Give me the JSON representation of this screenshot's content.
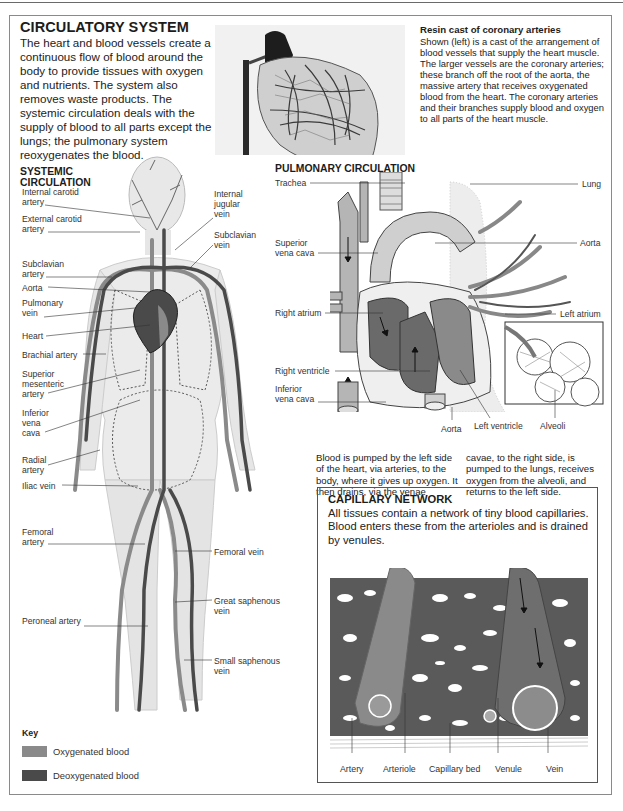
{
  "page": {
    "title": "CIRCULATORY SYSTEM",
    "intro": "The heart and blood vessels create a continuous flow of blood around the body to provide tissues with oxygen and nutrients. The system also removes waste products. The systemic circulation deals with the supply of blood to all parts except the lungs; the pulmonary system reoxygenates the blood."
  },
  "resin_cast": {
    "title": "Resin cast of coronary arteries",
    "body": "Shown (left) is a cast of the arrangement of blood vessels that supply the heart muscle. The larger vessels are the coronary arteries; these branch off the root of the aorta, the massive artery that receives oxygenated blood from the heart. The coronary arteries and their branches supply blood and oxygen to all parts of the heart muscle."
  },
  "systemic": {
    "title_line1": "SYSTEMIC",
    "title_line2": "CIRCULATION",
    "left_labels": [
      {
        "text1": "Internal carotid",
        "text2": "artery"
      },
      {
        "text1": "External carotid",
        "text2": "artery"
      },
      {
        "text1": "Subclavian",
        "text2": "artery"
      },
      {
        "text1": "Aorta",
        "text2": ""
      },
      {
        "text1": "Pulmonary",
        "text2": "vein"
      },
      {
        "text1": "Heart",
        "text2": ""
      },
      {
        "text1": "Brachial artery",
        "text2": ""
      },
      {
        "text1": "Superior",
        "text2": "mesenteric",
        "text3": "artery"
      },
      {
        "text1": "Inferior",
        "text2": "vena",
        "text3": "cava"
      },
      {
        "text1": "Radial",
        "text2": "artery"
      },
      {
        "text1": "Iliac vein",
        "text2": ""
      },
      {
        "text1": "Femoral",
        "text2": "artery"
      },
      {
        "text1": "Peroneal artery",
        "text2": ""
      }
    ],
    "right_labels": [
      {
        "text1": "Internal",
        "text2": "jugular",
        "text3": "vein"
      },
      {
        "text1": "Subclavian",
        "text2": "vein"
      },
      {
        "text1": "Femoral vein",
        "text2": ""
      },
      {
        "text1": "Great saphenous",
        "text2": "vein"
      },
      {
        "text1": "Small saphenous",
        "text2": "vein"
      }
    ]
  },
  "pulmonary": {
    "title": "PULMONARY CIRCULATION",
    "labels": {
      "trachea": "Trachea",
      "lung": "Lung",
      "superior_vena_cava_1": "Superior",
      "superior_vena_cava_2": "vena cava",
      "aorta_right": "Aorta",
      "right_atrium": "Right atrium",
      "left_atrium": "Left atrium",
      "right_ventricle": "Right ventricle",
      "inferior_vena_cava_1": "Inferior",
      "inferior_vena_cava_2": "vena cava",
      "aorta_bottom": "Aorta",
      "left_ventricle": "Left ventricle",
      "alveoli": "Alveoli"
    },
    "caption_col1": "Blood is pumped by the left side of the heart, via arteries, to the body, where it gives up oxygen. It then drains, via the venae",
    "caption_col2": "cavae, to the right side, is pumped to the lungs, receives oxygen from the alveoli, and returns to the left side."
  },
  "capillary": {
    "title": "CAPILLARY NETWORK",
    "body": "All tissues contain a network of tiny blood capillaries. Blood enters these from the arterioles and is drained by venules.",
    "labels": [
      "Artery",
      "Arteriole",
      "Capillary bed",
      "Venule",
      "Vein"
    ]
  },
  "key": {
    "title": "Key",
    "items": [
      {
        "label": "Oxygenated blood",
        "color": "#8a8a8a"
      },
      {
        "label": "Deoxygenated blood",
        "color": "#4a4a4a"
      }
    ]
  },
  "colors": {
    "oxygenated": "#8a8a8a",
    "deoxygenated": "#4a4a4a",
    "frame": "#8a8a8a"
  }
}
